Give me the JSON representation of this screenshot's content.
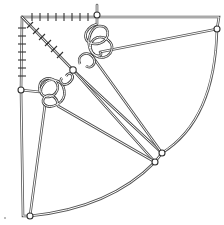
{
  "figure": {
    "title": "",
    "colors": {
      "background": "#ffffff",
      "rope": "#555555",
      "node": "#333333"
    },
    "nodes": [
      {
        "id": "corner",
        "x": 22,
        "y": 17
      },
      {
        "id": "top-node",
        "x": 97,
        "y": 15
      },
      {
        "id": "right-node",
        "x": 217,
        "y": 29
      },
      {
        "id": "left-node",
        "x": 21,
        "y": 90
      },
      {
        "id": "center-node",
        "x": 73,
        "y": 70
      },
      {
        "id": "arc-node-upper",
        "x": 162,
        "y": 153
      },
      {
        "id": "arc-node-lower",
        "x": 155,
        "y": 162
      },
      {
        "id": "bottom-node",
        "x": 30,
        "y": 216
      }
    ],
    "knots": [
      {
        "id": "upper-knot",
        "cx": 100,
        "cy": 40
      },
      {
        "id": "lower-knot",
        "cx": 47,
        "cy": 95
      }
    ],
    "annotations": []
  }
}
